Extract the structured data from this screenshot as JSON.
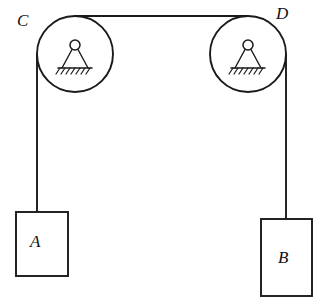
{
  "figure": {
    "background_color": "#ffffff",
    "line_color": "#1a1a1a",
    "width": 327,
    "height": 308
  },
  "labels": {
    "pulley_left": "C",
    "pulley_right": "D",
    "block_left": "A",
    "block_right": "B"
  },
  "pulleys": [
    {
      "name": "C",
      "center_x": 75,
      "center_y": 54,
      "radius": 38,
      "mount": "pin-support-on-hatched-ground"
    },
    {
      "name": "D",
      "center_x": 248,
      "center_y": 54,
      "radius": 38,
      "mount": "pin-support-on-hatched-ground"
    }
  ],
  "cords": [
    {
      "name": "top-cord",
      "from": "C",
      "to": "D",
      "orientation": "horizontal",
      "y": 16
    },
    {
      "name": "left-cord",
      "from": "C",
      "to": "A",
      "orientation": "vertical",
      "x": 37
    },
    {
      "name": "right-cord",
      "from": "D",
      "to": "B",
      "orientation": "vertical",
      "x": 286
    }
  ],
  "blocks": [
    {
      "name": "A",
      "x": 16,
      "y": 212,
      "width": 52,
      "height": 64
    },
    {
      "name": "B",
      "x": 261,
      "y": 219,
      "width": 51,
      "height": 77
    }
  ]
}
